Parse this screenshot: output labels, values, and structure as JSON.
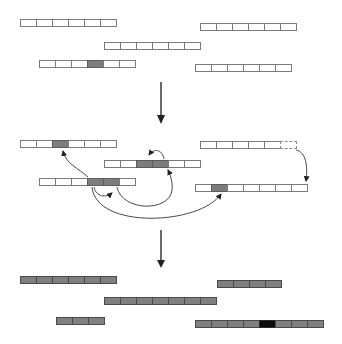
{
  "diagram": {
    "colors": {
      "cell_empty": "#ffffff",
      "cell_border": "#7a7a7a",
      "cell_shaded": "#7d7d7d",
      "cell_filled": "#808080",
      "cell_dark": "#0c0c0c",
      "arrow": "#333333"
    },
    "stages": [
      {
        "name": "initial",
        "bars": [
          {
            "id": "A",
            "x": 20,
            "y": 19,
            "cells": [
              "empty",
              "empty",
              "empty",
              "empty",
              "empty",
              "empty"
            ]
          },
          {
            "id": "B",
            "x": 200,
            "y": 23,
            "cells": [
              "empty",
              "empty",
              "empty",
              "empty",
              "empty",
              "empty"
            ]
          },
          {
            "id": "C",
            "x": 104,
            "y": 42,
            "cells": [
              "empty",
              "empty",
              "empty",
              "empty",
              "empty",
              "empty"
            ]
          },
          {
            "id": "D",
            "x": 39,
            "y": 60,
            "cells": [
              "empty",
              "empty",
              "empty",
              "shaded",
              "empty",
              "empty"
            ]
          },
          {
            "id": "E",
            "x": 195,
            "y": 64,
            "cells": [
              "empty",
              "empty",
              "empty",
              "empty",
              "empty",
              "empty"
            ]
          }
        ]
      },
      {
        "name": "transfer",
        "bars": [
          {
            "id": "F",
            "x": 20,
            "y": 140,
            "cells": [
              "empty",
              "empty",
              "shaded",
              "empty",
              "empty",
              "empty"
            ]
          },
          {
            "id": "G",
            "x": 104,
            "y": 160,
            "cells": [
              "empty",
              "empty",
              "shaded",
              "shaded",
              "empty",
              "empty"
            ]
          },
          {
            "id": "H",
            "x": 200,
            "y": 141,
            "cells": [
              "empty",
              "empty",
              "empty",
              "empty",
              "empty",
              "dashed"
            ]
          },
          {
            "id": "I",
            "x": 39,
            "y": 178,
            "cells": [
              "empty",
              "empty",
              "empty",
              "shaded",
              "shaded",
              "empty"
            ]
          },
          {
            "id": "J",
            "x": 195,
            "y": 184,
            "cells": [
              "empty",
              "shaded",
              "empty",
              "empty",
              "empty",
              "empty",
              "empty"
            ]
          }
        ],
        "arrows": [
          {
            "from": "I cell 4",
            "to": "F cell 3"
          },
          {
            "from": "I cell 4",
            "to": "I cell 5"
          },
          {
            "from": "I cell 5",
            "to": "G cell 4"
          },
          {
            "from": "G cell 4",
            "to": "G cell 3"
          },
          {
            "from": "I cell 4",
            "to": "J cell 2"
          },
          {
            "from": "H dashed cell",
            "to": "J cell 7"
          }
        ]
      },
      {
        "name": "result",
        "bars": [
          {
            "id": "K",
            "x": 20,
            "y": 276,
            "cells": [
              "filled",
              "filled",
              "filled",
              "filled",
              "filled",
              "filled"
            ]
          },
          {
            "id": "M",
            "x": 217,
            "y": 280,
            "cells": [
              "filled",
              "filled",
              "filled",
              "filled"
            ]
          },
          {
            "id": "L",
            "x": 104,
            "y": 297,
            "cells": [
              "filled",
              "filled",
              "filled",
              "filled",
              "filled",
              "filled",
              "filled"
            ]
          },
          {
            "id": "N",
            "x": 56,
            "y": 317,
            "cells": [
              "filled",
              "filled",
              "filled"
            ]
          },
          {
            "id": "O",
            "x": 195,
            "y": 320,
            "cells": [
              "filled",
              "filled",
              "filled",
              "filled",
              "dark",
              "filled",
              "filled",
              "filled"
            ]
          }
        ]
      }
    ],
    "stage_arrows": [
      {
        "x": 161,
        "y1": 82,
        "y2": 124
      },
      {
        "x": 161,
        "y1": 230,
        "y2": 268
      }
    ]
  }
}
